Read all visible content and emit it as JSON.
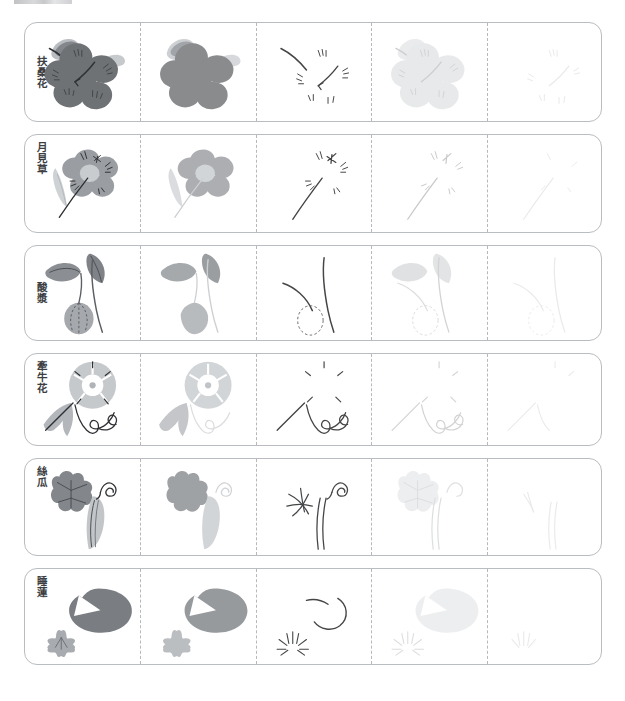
{
  "document": {
    "title": "",
    "type": "brush-painting practice worksheet",
    "column_count": 5,
    "row_count": 6,
    "header_sliver_visible": true
  },
  "columns": [
    {
      "index": 1,
      "stage": "full-color model",
      "opacity": 1.0
    },
    {
      "index": 2,
      "stage": "color without ink lines",
      "opacity": 0.82
    },
    {
      "index": 3,
      "stage": "ink lines only",
      "opacity": 0.9
    },
    {
      "index": 4,
      "stage": "faded guide",
      "opacity": 0.3
    },
    {
      "index": 5,
      "stage": "very faint tracing guide",
      "opacity": 0.1
    }
  ],
  "rows": [
    {
      "id": "row-1",
      "label": "扶桑花",
      "subject": "hibiscus",
      "label_position": "middle",
      "colors": {
        "petal": "#6f7275",
        "leaf_dark": "#7d8185",
        "leaf_light": "#c2c5c8",
        "ink": "#2f3134"
      }
    },
    {
      "id": "row-2",
      "label": "月見草",
      "subject": "evening-primrose",
      "label_position": "top",
      "colors": {
        "petal": "#9a9da1",
        "center": "#c9ccce",
        "leaf": "#cfd2d5",
        "ink": "#2f3134"
      }
    },
    {
      "id": "row-3",
      "label": "酸漿",
      "subject": "chinese-lantern",
      "label_position": "middle",
      "colors": {
        "leaf": "#8b8f93",
        "lantern": "#a5a8ac",
        "stem": "#5c5f63",
        "ink": "#2f3134"
      }
    },
    {
      "id": "row-4",
      "label": "牽牛花",
      "subject": "morning-glory",
      "label_position": "top",
      "colors": {
        "petal": "#c6c9cc",
        "leaf": "#b3b6ba",
        "ink": "#2f3134"
      }
    },
    {
      "id": "row-5",
      "label": "絲瓜",
      "subject": "loofah-gourd",
      "label_position": "top",
      "colors": {
        "leaf": "#83878b",
        "gourd": "#c3c6c9",
        "ink": "#2f3134"
      }
    },
    {
      "id": "row-6",
      "label": "睡蓮",
      "subject": "water-lily",
      "label_position": "top",
      "colors": {
        "pad": "#7a7e82",
        "flower": "#b0b3b7",
        "ink": "#2f3134"
      }
    }
  ]
}
